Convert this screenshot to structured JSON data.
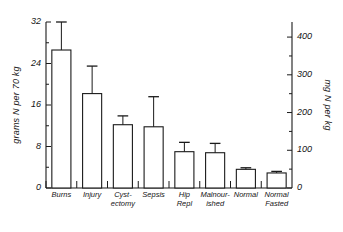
{
  "chart_data": {
    "type": "bar",
    "title": "",
    "subtitle": "",
    "xlabel": "",
    "ylabel": "grams N per 70 kg",
    "ylabel_right": "mg N per kg",
    "categories": [
      "Burns",
      "Injury",
      "Cyst-\nectomy",
      "Sepsis",
      "Hip\nRepl",
      "Malnour-\nished",
      "Normal",
      "Normal\nFasted"
    ],
    "categories_plain": [
      "Burns",
      "Injury",
      "Cystectomy",
      "Sepsis",
      "Hip Repl",
      "Malnourished",
      "Normal",
      "Normal Fasted"
    ],
    "values": [
      26.6,
      18.2,
      12.2,
      11.8,
      7.0,
      6.8,
      3.6,
      2.9
    ],
    "errors_upper": [
      32.0,
      23.5,
      13.9,
      17.6,
      8.8,
      8.6,
      3.9,
      3.2
    ],
    "values_right_axis": [
      333,
      228,
      153,
      148,
      88,
      85,
      45,
      36
    ],
    "ylim": [
      0,
      32
    ],
    "yticks": [
      0,
      8,
      16,
      24,
      32
    ],
    "ytick_labels": [
      "0",
      "8",
      "16",
      "24",
      "32"
    ],
    "ylim_right": [
      0,
      440
    ],
    "yticks_right": [
      0,
      100,
      200,
      300,
      400
    ],
    "ytick_labels_right": [
      "0",
      "100",
      "200",
      "300",
      "400"
    ],
    "yminor_right": [
      50,
      150,
      250,
      350
    ],
    "grid": false,
    "legend": false,
    "bar_fill": "#ffffff",
    "bar_edge": "#1a1a1a",
    "error_bar_color": "#1a1a1a",
    "axis_color": "#1a1a1a"
  },
  "axes": {
    "left_title": "grams N per 70 kg",
    "right_title": "mg N per kg"
  }
}
